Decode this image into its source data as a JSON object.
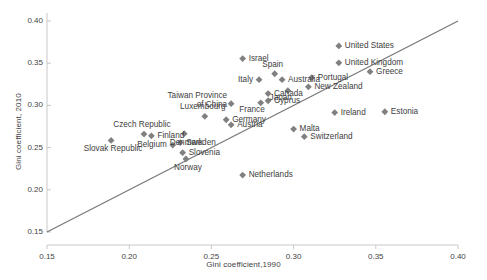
{
  "chart_data": {
    "type": "scatter",
    "title": "",
    "xlabel": "Gini coefficient,1990",
    "ylabel": "Gini coefficient, 2010",
    "xlim": [
      0.15,
      0.4
    ],
    "ylim": [
      0.15,
      0.4
    ],
    "xticks": [
      "0.15",
      "0.20",
      "0.25",
      "0.30",
      "0.35",
      "0.40"
    ],
    "yticks": [
      "0.15",
      "0.20",
      "0.25",
      "0.30",
      "0.35",
      "0.40"
    ],
    "xtick_values": [
      0.15,
      0.2,
      0.25,
      0.3,
      0.35,
      0.4
    ],
    "ytick_values": [
      0.15,
      0.2,
      0.25,
      0.3,
      0.35,
      0.4
    ],
    "grid": false,
    "legend": "none",
    "marker_color": "#808080",
    "line_color": "#7b7b7b",
    "reference_line": {
      "name": "45-degree line",
      "from": [
        0.15,
        0.15
      ],
      "to": [
        0.4,
        0.4
      ]
    },
    "points": [
      {
        "label": "United States",
        "x": 0.3275,
        "y": 0.3705,
        "label_pos": "right"
      },
      {
        "label": "United Kingdom",
        "x": 0.3275,
        "y": 0.3505,
        "label_pos": "right"
      },
      {
        "label": "Israel",
        "x": 0.269,
        "y": 0.3555,
        "label_pos": "right"
      },
      {
        "label": "Greece",
        "x": 0.3465,
        "y": 0.34,
        "label_pos": "right"
      },
      {
        "label": "Portugal",
        "x": 0.311,
        "y": 0.333,
        "label_pos": "right"
      },
      {
        "label": "Spain",
        "x": 0.2885,
        "y": 0.3375,
        "label_pos": "above"
      },
      {
        "label": "Italy",
        "x": 0.279,
        "y": 0.3305,
        "label_pos": "left"
      },
      {
        "label": "Australia",
        "x": 0.293,
        "y": 0.3305,
        "label_pos": "right"
      },
      {
        "label": "New Zealand",
        "x": 0.309,
        "y": 0.322,
        "label_pos": "right"
      },
      {
        "label": "Japan",
        "x": 0.2965,
        "y": 0.3175,
        "label_pos": "below-left"
      },
      {
        "label": "Canada",
        "x": 0.2845,
        "y": 0.314,
        "label_pos": "right"
      },
      {
        "label": "Cyprus",
        "x": 0.2845,
        "y": 0.3055,
        "label_pos": "right"
      },
      {
        "label": "France",
        "x": 0.28,
        "y": 0.303,
        "label_pos": "below-left"
      },
      {
        "label": "Taiwan Province of China",
        "x": 0.262,
        "y": 0.302,
        "label_pos": "left-two-line"
      },
      {
        "label": "Ireland",
        "x": 0.325,
        "y": 0.2915,
        "label_pos": "right"
      },
      {
        "label": "Estonia",
        "x": 0.3555,
        "y": 0.2925,
        "label_pos": "right"
      },
      {
        "label": "Luxembourg",
        "x": 0.246,
        "y": 0.287,
        "label_pos": "above"
      },
      {
        "label": "Germany",
        "x": 0.259,
        "y": 0.283,
        "label_pos": "right"
      },
      {
        "label": "Austria",
        "x": 0.262,
        "y": 0.277,
        "label_pos": "right"
      },
      {
        "label": "Czech Republic",
        "x": 0.209,
        "y": 0.266,
        "label_pos": "above"
      },
      {
        "label": "Finland",
        "x": 0.2135,
        "y": 0.264,
        "label_pos": "right"
      },
      {
        "label": "Denmark",
        "x": 0.2335,
        "y": 0.2665,
        "label_pos": "below"
      },
      {
        "label": "Malta",
        "x": 0.3,
        "y": 0.272,
        "label_pos": "right"
      },
      {
        "label": "Switzerland",
        "x": 0.3065,
        "y": 0.263,
        "label_pos": "right"
      },
      {
        "label": "Slovak Republic",
        "x": 0.189,
        "y": 0.2585,
        "label_pos": "below"
      },
      {
        "label": "Belgium",
        "x": 0.2265,
        "y": 0.253,
        "label_pos": "left"
      },
      {
        "label": "Sweden",
        "x": 0.231,
        "y": 0.256,
        "label_pos": "right"
      },
      {
        "label": "Slovenia",
        "x": 0.2325,
        "y": 0.244,
        "label_pos": "right"
      },
      {
        "label": "Norway",
        "x": 0.2345,
        "y": 0.2365,
        "label_pos": "below"
      },
      {
        "label": "Netherlands",
        "x": 0.269,
        "y": 0.2175,
        "label_pos": "right"
      }
    ]
  },
  "labels": {
    "united_states": "United States",
    "united_kingdom": "United Kingdom",
    "israel": "Israel",
    "greece": "Greece",
    "portugal": "Portugal",
    "spain": "Spain",
    "italy": "Italy",
    "australia": "Australia",
    "new_zealand": "New Zealand",
    "japan": "Japan",
    "canada": "Canada",
    "cyprus": "Cyprus",
    "france": "France",
    "taiwan_line1": "Taiwan Province",
    "taiwan_line2": "of China",
    "ireland": "Ireland",
    "estonia": "Estonia",
    "luxembourg": "Luxembourg",
    "germany": "Germany",
    "austria": "Austria",
    "czech_republic": "Czech Republic",
    "finland": "Finland",
    "denmark": "Denmark",
    "malta": "Malta",
    "switzerland": "Switzerland",
    "slovak_republic": "Slovak Republic",
    "belgium": "Belgium",
    "sweden": "Sweden",
    "slovenia": "Slovenia",
    "norway": "Norway",
    "netherlands": "Netherlands"
  }
}
